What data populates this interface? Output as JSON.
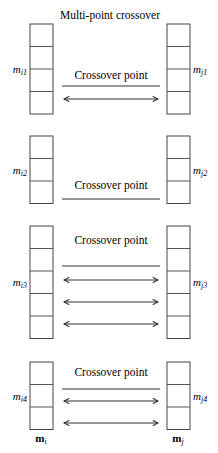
{
  "title": "Multi-point crossover",
  "crossover_label": "Crossover point",
  "parents": {
    "left": {
      "base": "m",
      "sub": "i"
    },
    "right": {
      "base": "m",
      "sub": "j"
    }
  },
  "groups": [
    {
      "left_label": {
        "base": "m",
        "sub": "i1"
      },
      "right_label": {
        "base": "m",
        "sub": "j1"
      },
      "cells": 4,
      "crossover_points": 1,
      "swap_arrows": 1,
      "show_crossover_label": true
    },
    {
      "left_label": {
        "base": "m",
        "sub": "i2"
      },
      "right_label": {
        "base": "m",
        "sub": "j2"
      },
      "cells": 3,
      "crossover_points": 1,
      "swap_arrows": 0,
      "show_crossover_label": true
    },
    {
      "left_label": {
        "base": "m",
        "sub": "i3"
      },
      "right_label": {
        "base": "m",
        "sub": "j3"
      },
      "cells": 5,
      "crossover_points": 1,
      "swap_arrows": 3,
      "show_crossover_label": true
    },
    {
      "left_label": {
        "base": "m",
        "sub": "i4"
      },
      "right_label": {
        "base": "m",
        "sub": "j4"
      },
      "cells": 3,
      "crossover_points": 1,
      "swap_arrows": 2,
      "show_crossover_label": true
    }
  ]
}
